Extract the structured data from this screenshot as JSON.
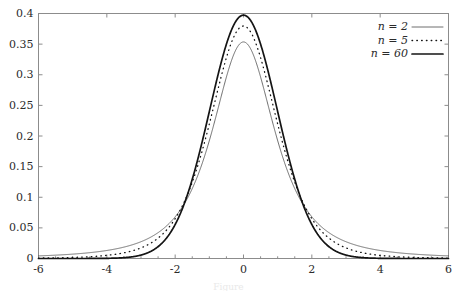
{
  "chart_data": {
    "type": "line",
    "title": "",
    "xlabel": "",
    "ylabel": "",
    "xlim": [
      -6,
      6
    ],
    "ylim": [
      0,
      0.4
    ],
    "grid": false,
    "legend_position": "top-right",
    "x_ticks": [
      -6,
      -4,
      -2,
      0,
      2,
      4,
      6
    ],
    "x_tick_labels": [
      "-6",
      "-4",
      "-2",
      "0",
      "2",
      "4",
      "6"
    ],
    "x_minor_tick_step": 0.5,
    "y_ticks": [
      0,
      0.05,
      0.1,
      0.15,
      0.2,
      0.25,
      0.3,
      0.35,
      0.4
    ],
    "y_tick_labels": [
      "0",
      "0.05",
      "0.1",
      "0.15",
      "0.2",
      "0.25",
      "0.3",
      "0.35",
      "0.4"
    ],
    "distribution": "student-t-pdf",
    "series": [
      {
        "name": "n = 2",
        "df": 2,
        "style": "solid-thin",
        "peak": 0.3536,
        "x": [
          -6,
          -5,
          -4,
          -3,
          -2,
          -1.5,
          -1,
          -0.5,
          0,
          0.5,
          1,
          1.5,
          2,
          3,
          4,
          5,
          6
        ],
        "values": [
          0.0064,
          0.0109,
          0.0203,
          0.0422,
          0.0962,
          0.1475,
          0.1924,
          0.2962,
          0.3536,
          0.2962,
          0.1924,
          0.1475,
          0.0962,
          0.0422,
          0.0203,
          0.0109,
          0.0064
        ]
      },
      {
        "name": "n = 5",
        "df": 5,
        "style": "dotted",
        "peak": 0.3796,
        "x": [
          -6,
          -5,
          -4,
          -3,
          -2,
          -1.5,
          -1,
          -0.5,
          0,
          0.5,
          1,
          1.5,
          2,
          3,
          4,
          5,
          6
        ],
        "values": [
          0.0012,
          0.0027,
          0.0076,
          0.0174,
          0.0651,
          0.1245,
          0.2197,
          0.3279,
          0.3796,
          0.3279,
          0.2197,
          0.1245,
          0.0651,
          0.0174,
          0.0076,
          0.0027,
          0.0012
        ]
      },
      {
        "name": "n = 60",
        "df": 60,
        "style": "solid-thick",
        "peak": 0.3989,
        "x": [
          -6,
          -5,
          -4,
          -3,
          -2,
          -1.5,
          -1,
          -0.5,
          0,
          0.5,
          1,
          1.5,
          2,
          3,
          4,
          5,
          6
        ],
        "values": [
          0.0,
          0.0,
          0.0002,
          0.0046,
          0.0532,
          0.128,
          0.2392,
          0.3506,
          0.3989,
          0.3506,
          0.2392,
          0.128,
          0.0532,
          0.0046,
          0.0002,
          0.0,
          0.0
        ]
      }
    ]
  },
  "legend": {
    "entries": [
      {
        "label": "n = 2",
        "style": "solid-thin"
      },
      {
        "label": "n = 5",
        "style": "dotted"
      },
      {
        "label": "n = 60",
        "style": "solid-thick"
      }
    ]
  },
  "caption": {
    "text": "Figure"
  },
  "colors": {
    "background": "#ffffff",
    "frame": "#8c8c8c",
    "curve": "#141414",
    "curve_thin": "#4a4a4a",
    "text": "#2b2b2b"
  }
}
